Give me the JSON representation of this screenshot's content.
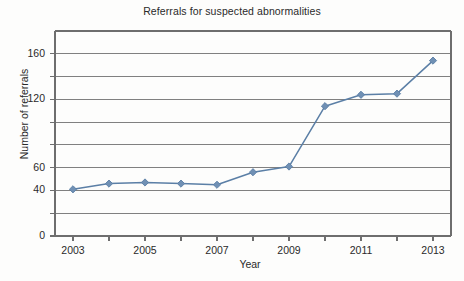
{
  "chart_data": {
    "type": "line",
    "title": "Referrals for suspected abnormalities",
    "xlabel": "Year",
    "ylabel": "Number of referrals",
    "x": [
      2003,
      2004,
      2005,
      2006,
      2007,
      2008,
      2009,
      2010,
      2011,
      2012,
      2013
    ],
    "values": [
      41,
      46,
      47,
      46,
      45,
      56,
      61,
      114,
      124,
      125,
      154
    ],
    "series": [
      {
        "name": "Referrals",
        "values": [
          41,
          46,
          47,
          46,
          45,
          56,
          61,
          114,
          124,
          125,
          154
        ]
      }
    ],
    "xlim": [
      2002.5,
      2013.5
    ],
    "ylim": [
      0,
      180
    ],
    "xtick_labels": [
      "2003",
      "2005",
      "2007",
      "2009",
      "2011",
      "2013"
    ],
    "xtick_values": [
      2003,
      2005,
      2007,
      2009,
      2011,
      2013
    ],
    "xtick_minor_values": [
      2004,
      2006,
      2008,
      2010,
      2012
    ],
    "ytick_labels": [
      "160",
      "120",
      "60",
      "40",
      "0"
    ],
    "ytick_label_positions": [
      160,
      120,
      60,
      40,
      0
    ],
    "ygrid_values": [
      0,
      20,
      40,
      60,
      80,
      100,
      120,
      140,
      160
    ],
    "grid": true,
    "legend": "none",
    "marker": "diamond",
    "line_color": "#5b7fa6",
    "marker_color": "#7090b4",
    "grid_color": "#808080",
    "axis_color": "#6e6e6e",
    "background": "#fdfdfc"
  }
}
